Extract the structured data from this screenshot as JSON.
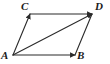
{
  "figure": {
    "background_color": "#ffffff",
    "stroke_color": "#2b2b2b",
    "label_color": "#1a1a1a",
    "stroke_width": 1.1,
    "width": 110,
    "height": 64,
    "vertices": [
      {
        "id": "A",
        "label": "A",
        "x": 13,
        "y": 55,
        "position": "bottom-left"
      },
      {
        "id": "B",
        "label": "B",
        "x": 75,
        "y": 55,
        "position": "bottom-right"
      },
      {
        "id": "C",
        "label": "C",
        "x": 30,
        "y": 14,
        "position": "top-left"
      },
      {
        "id": "D",
        "label": "D",
        "x": 92,
        "y": 14,
        "position": "top-right"
      }
    ],
    "segments": [
      {
        "id": "AB",
        "from": "A",
        "to": "B",
        "arrow_at_end": true,
        "kind": "side"
      },
      {
        "id": "AC",
        "from": "A",
        "to": "C",
        "arrow_at_end": true,
        "kind": "side"
      },
      {
        "id": "CD",
        "from": "C",
        "to": "D",
        "arrow_at_end": true,
        "kind": "side"
      },
      {
        "id": "BD",
        "from": "B",
        "to": "D",
        "arrow_at_end": false,
        "kind": "side"
      },
      {
        "id": "AD",
        "from": "A",
        "to": "D",
        "arrow_at_end": true,
        "kind": "diagonal"
      }
    ]
  }
}
